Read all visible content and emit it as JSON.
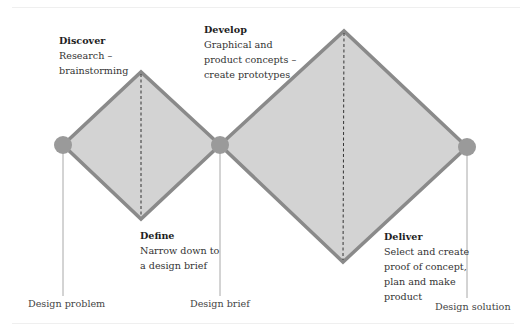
{
  "diagram": {
    "type": "double-diamond",
    "colors": {
      "fill": "#d3d3d3",
      "stroke": "#8a8a8a",
      "node": "#9a9a9a",
      "connector": "#a8a8a8",
      "divider": "#333333"
    },
    "phases": [
      {
        "title": "Discover",
        "description_lines": [
          "Research –",
          "brainstorming"
        ]
      },
      {
        "title": "Define",
        "description_lines": [
          "Narrow down to",
          "a design brief"
        ]
      },
      {
        "title": "Develop",
        "description_lines": [
          "Graphical and",
          "product concepts –",
          "create prototypes"
        ]
      },
      {
        "title": "Deliver",
        "description_lines": [
          "Select and create",
          "proof of concept,",
          "plan and make",
          "product"
        ]
      }
    ],
    "milestones": [
      {
        "label": "Design problem"
      },
      {
        "label": "Design brief"
      },
      {
        "label": "Design solution"
      }
    ]
  }
}
